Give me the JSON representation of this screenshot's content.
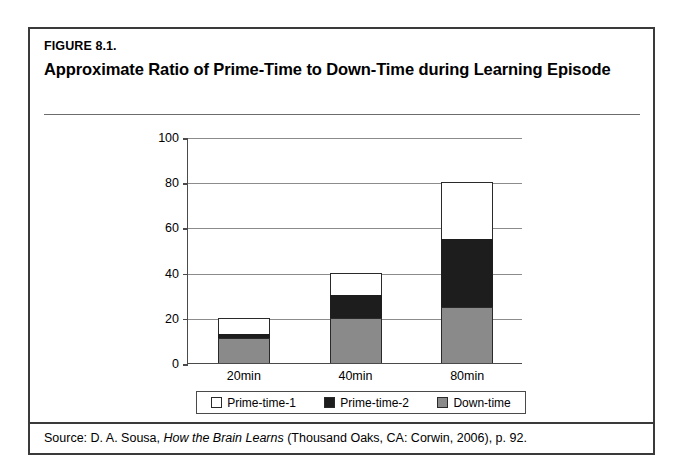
{
  "figure": {
    "label": "FIGURE 8.1.",
    "title": "Approximate Ratio of Prime-Time to Down-Time during Learning Episode"
  },
  "source": {
    "prefix": "Source: D. A. Sousa, ",
    "book": "How the Brain Learns",
    "suffix": " (Thousand Oaks, CA: Corwin, 2006), p. 92."
  },
  "colors": {
    "prime_time_1": "#ffffff",
    "prime_time_2": "#1d1d1d",
    "down_time": "#8a8a8a",
    "axis": "#4a4a4a",
    "grid": "#8c8c8c",
    "frame": "#3a3a3a"
  },
  "legend": {
    "items": [
      {
        "label": "Prime-time-1",
        "swatch": "prime1"
      },
      {
        "label": "Prime-time-2",
        "swatch": "prime2"
      },
      {
        "label": "Down-time",
        "swatch": "down"
      }
    ]
  },
  "chart_data": {
    "type": "bar",
    "stacked": true,
    "title": "Approximate Ratio of Prime-Time to Down-Time during Learning Episode",
    "xlabel": "Length of Lesson Time",
    "ylabel": "",
    "categories": [
      "20min",
      "40min",
      "80min"
    ],
    "ylim": [
      0,
      100
    ],
    "yticks": [
      0,
      20,
      40,
      60,
      80,
      100
    ],
    "ytick_labels": [
      "0",
      "20",
      "40",
      "60",
      "80",
      "100"
    ],
    "grid": true,
    "legend_position": "bottom",
    "series": [
      {
        "name": "Down-time",
        "values": [
          11,
          20,
          25
        ]
      },
      {
        "name": "Prime-time-2",
        "values": [
          2,
          10,
          30
        ]
      },
      {
        "name": "Prime-time-1",
        "values": [
          7,
          10,
          25
        ]
      }
    ],
    "totals": [
      20,
      40,
      80
    ]
  }
}
